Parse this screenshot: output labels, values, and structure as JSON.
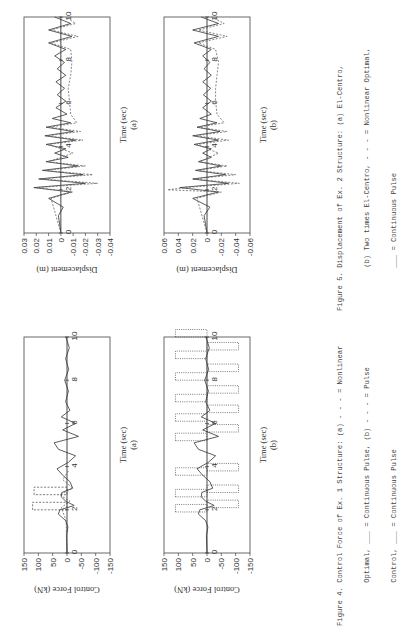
{
  "figure4": {
    "caption_lines": [
      "Figure 4. Control Force of Ex. 1 Structure: (a) - - - = Nonlinear",
      "          Optimal, ___ = Continuous Pulse, (b) - - - = Pulse",
      "          Control, ___ = Continuous Pulse"
    ],
    "charts": [
      {
        "id": "a",
        "ylabel": "Control Force (kN)",
        "xlabel": "Time (sec)",
        "sublabel": "(a)",
        "yticks": [
          "150",
          "100",
          "50",
          "0",
          "-50",
          "-100",
          "-150"
        ],
        "xticks": [
          "0",
          "2",
          "4",
          "6",
          "8",
          "10"
        ]
      },
      {
        "id": "b",
        "ylabel": "Control Force (kN)",
        "xlabel": "Time (sec)",
        "sublabel": "(b)",
        "yticks": [
          "150",
          "100",
          "50",
          "0",
          "-50",
          "-100",
          "-150"
        ],
        "xticks": [
          "0",
          "2",
          "4",
          "6",
          "8",
          "10"
        ]
      }
    ]
  },
  "figure5": {
    "caption_lines": [
      "Figure 5. Displacement of Ex. 2 Structure: (a) El-Centro,",
      "          (b) Two times El-Centro, - - - = Nonlinear Optimal,",
      "          ___ = Continuous Pulse"
    ],
    "charts": [
      {
        "id": "a",
        "ylabel": "Displacement (m)",
        "xlabel": "Time (sec)",
        "sublabel": "(a)",
        "yticks": [
          "0.03",
          "0.02",
          "0.01",
          "0",
          "-0.01",
          "-0.02",
          "-0.03",
          "-0.04"
        ],
        "xticks": [
          "0",
          "2",
          "4",
          "6",
          "8",
          "10"
        ]
      },
      {
        "id": "b",
        "ylabel": "Displacement (m)",
        "xlabel": "Time (sec)",
        "sublabel": "(b)",
        "yticks": [
          "0.06",
          "0.04",
          "0.02",
          "0",
          "-0.02",
          "-0.04",
          "-0.06"
        ],
        "xticks": [
          "0",
          "2",
          "4",
          "6",
          "8",
          "10"
        ]
      }
    ]
  },
  "chart_data": [
    {
      "type": "line",
      "title": "Figure 4(a) Control Force of Ex. 1 Structure",
      "xlabel": "Time (sec)",
      "ylabel": "Control Force (kN)",
      "xlim": [
        0,
        10
      ],
      "ylim": [
        -150,
        150
      ],
      "series": [
        {
          "name": "Continuous Pulse",
          "style": "solid",
          "x": [
            0,
            0.8,
            1.2,
            1.5,
            1.8,
            2.0,
            2.2,
            2.4,
            2.6,
            2.8,
            3.0,
            3.3,
            3.6,
            3.9,
            4.2,
            4.5,
            4.8,
            5.1,
            5.4,
            5.7,
            6.0,
            6.3,
            6.6,
            7.0,
            7.5,
            8.0,
            8.5,
            9.0,
            9.5,
            10.0
          ],
          "y": [
            0,
            2,
            -3,
            5,
            30,
            25,
            -25,
            5,
            20,
            18,
            -20,
            -10,
            15,
            35,
            -5,
            -30,
            30,
            45,
            -40,
            15,
            -30,
            20,
            -10,
            5,
            -5,
            8,
            -6,
            5,
            -8,
            4
          ]
        },
        {
          "name": "Nonlinear Optimal",
          "style": "dashed",
          "pulses": [
            {
              "t": 2.0,
              "y": 120
            },
            {
              "t": 2.7,
              "y": 115
            }
          ],
          "x": [
            0,
            1.5,
            2.1,
            2.4,
            2.7,
            3.0,
            3.4,
            3.8
          ],
          "y": [
            0,
            3,
            20,
            -10,
            25,
            -20,
            15,
            -5
          ]
        }
      ]
    },
    {
      "type": "line",
      "title": "Figure 4(b) Control Force of Ex. 1 Structure",
      "xlabel": "Time (sec)",
      "ylabel": "Control Force (kN)",
      "xlim": [
        0,
        10
      ],
      "ylim": [
        -150,
        150
      ],
      "series": [
        {
          "name": "Continuous Pulse",
          "style": "solid",
          "x": [
            0,
            0.8,
            1.2,
            1.5,
            1.8,
            2.0,
            2.2,
            2.4,
            2.6,
            2.8,
            3.0,
            3.3,
            3.6,
            3.9,
            4.2,
            4.5,
            4.8,
            5.1,
            5.4,
            5.7,
            6.0,
            6.3,
            6.6,
            7.0,
            7.5,
            8.0,
            8.5,
            9.0,
            9.5,
            10.0
          ],
          "y": [
            0,
            2,
            -3,
            5,
            30,
            25,
            -25,
            5,
            20,
            18,
            -20,
            -10,
            15,
            35,
            -5,
            -30,
            30,
            45,
            -40,
            15,
            -30,
            20,
            -10,
            5,
            -5,
            8,
            -6,
            5,
            -8,
            4
          ]
        },
        {
          "name": "Pulse Control",
          "style": "dotted",
          "pulses": [
            {
              "t": 1.9,
              "y": 110
            },
            {
              "t": 2.1,
              "y": -110
            },
            {
              "t": 2.6,
              "y": 110
            },
            {
              "t": 2.8,
              "y": -110
            },
            {
              "t": 3.6,
              "y": 110
            },
            {
              "t": 3.8,
              "y": -110
            },
            {
              "t": 5.2,
              "y": 110
            },
            {
              "t": 5.6,
              "y": -110
            },
            {
              "t": 6.1,
              "y": 110
            },
            {
              "t": 6.5,
              "y": -110
            },
            {
              "t": 7.0,
              "y": 110
            },
            {
              "t": 7.4,
              "y": -110
            },
            {
              "t": 8.0,
              "y": 110
            },
            {
              "t": 8.4,
              "y": -110
            },
            {
              "t": 9.0,
              "y": 110
            },
            {
              "t": 9.4,
              "y": -110
            },
            {
              "t": 10.0,
              "y": 110
            }
          ]
        }
      ]
    },
    {
      "type": "line",
      "title": "Figure 5(a) Displacement of Ex. 2 Structure, El-Centro",
      "xlabel": "Time (sec)",
      "ylabel": "Displacement (m)",
      "xlim": [
        0,
        10
      ],
      "ylim": [
        -0.04,
        0.03
      ],
      "series": [
        {
          "name": "Continuous Pulse",
          "style": "solid",
          "x": [
            0,
            0.8,
            1.2,
            1.6,
            1.9,
            2.1,
            2.3,
            2.5,
            2.7,
            2.9,
            3.1,
            3.3,
            3.5,
            3.7,
            3.9,
            4.1,
            4.3,
            4.5,
            4.7,
            4.9,
            5.1,
            5.3,
            5.5,
            5.8,
            6.1,
            6.4,
            6.7,
            7.0,
            7.3,
            7.6,
            7.9,
            8.2,
            8.5,
            8.8,
            9.1,
            9.4,
            9.7,
            10.0
          ],
          "y": [
            0,
            0.002,
            -0.002,
            0.01,
            -0.008,
            0.022,
            -0.02,
            0.018,
            -0.018,
            0.015,
            -0.014,
            0.012,
            -0.006,
            0.005,
            -0.004,
            0.012,
            -0.012,
            0.013,
            -0.01,
            0.012,
            -0.008,
            0.007,
            -0.005,
            0.004,
            -0.004,
            0.003,
            -0.003,
            0.004,
            -0.004,
            0.003,
            -0.003,
            0.005,
            -0.004,
            0.01,
            -0.009,
            0.01,
            -0.008,
            0.005
          ]
        },
        {
          "name": "Nonlinear Optimal",
          "style": "dashed",
          "x": [
            0,
            1.6,
            1.9,
            2.1,
            2.3,
            2.5,
            2.7,
            2.9,
            3.1,
            3.3,
            3.7,
            4.1,
            4.3,
            4.5,
            4.7,
            4.9,
            5.1,
            5.5,
            6.1,
            6.7,
            7.3,
            7.9,
            8.5,
            8.8,
            9.1,
            9.4,
            9.7,
            10.0
          ],
          "y": [
            0,
            0.008,
            -0.01,
            0.02,
            -0.03,
            0.017,
            -0.026,
            0.013,
            -0.02,
            0.01,
            -0.01,
            0.01,
            -0.018,
            0.011,
            -0.016,
            0.009,
            -0.013,
            -0.008,
            -0.007,
            -0.006,
            -0.008,
            -0.009,
            -0.008,
            0.008,
            -0.014,
            0.008,
            -0.012,
            -0.004
          ]
        }
      ]
    },
    {
      "type": "line",
      "title": "Figure 5(b) Displacement of Ex. 2 Structure, Two times El-Centro",
      "xlabel": "Time (sec)",
      "ylabel": "Displacement (m)",
      "xlim": [
        0,
        10
      ],
      "ylim": [
        -0.06,
        0.06
      ],
      "series": [
        {
          "name": "Continuous Pulse",
          "style": "solid",
          "x": [
            0,
            0.8,
            1.2,
            1.6,
            1.9,
            2.1,
            2.3,
            2.5,
            2.7,
            2.9,
            3.1,
            3.3,
            3.5,
            3.7,
            3.9,
            4.1,
            4.3,
            4.5,
            4.7,
            4.9,
            5.1,
            5.3,
            5.5,
            5.8,
            6.1,
            6.4,
            6.7,
            7.0,
            7.3,
            7.6,
            7.9,
            8.2,
            8.5,
            8.8,
            9.1,
            9.4,
            9.7,
            10.0
          ],
          "y": [
            0,
            0.004,
            -0.004,
            0.02,
            -0.016,
            0.038,
            -0.03,
            0.02,
            -0.026,
            0.016,
            -0.02,
            0.012,
            -0.006,
            0.006,
            -0.006,
            0.018,
            -0.016,
            0.02,
            -0.018,
            0.014,
            -0.014,
            0.01,
            -0.006,
            0.006,
            -0.006,
            0.005,
            -0.005,
            0.006,
            -0.006,
            0.004,
            -0.004,
            0.006,
            -0.006,
            0.018,
            -0.016,
            0.02,
            -0.016,
            0.008
          ]
        },
        {
          "name": "Nonlinear Optimal",
          "style": "dashed",
          "x": [
            0,
            1.6,
            1.9,
            2.0,
            2.1,
            2.3,
            2.5,
            2.7,
            2.9,
            3.1,
            3.3,
            3.7,
            4.1,
            4.3,
            4.5,
            4.7,
            4.9,
            5.1,
            5.5,
            6.1,
            6.7,
            7.3,
            7.9,
            8.5,
            8.8,
            9.1,
            9.4,
            9.7,
            10.0
          ],
          "y": [
            0,
            0.014,
            -0.02,
            0.055,
            0.03,
            -0.045,
            0.02,
            -0.04,
            0.014,
            -0.028,
            0.01,
            -0.016,
            0.014,
            -0.03,
            0.016,
            -0.028,
            0.012,
            -0.024,
            -0.014,
            -0.012,
            -0.012,
            -0.014,
            -0.016,
            -0.012,
            0.012,
            -0.028,
            0.012,
            -0.024,
            -0.006
          ]
        }
      ]
    }
  ]
}
